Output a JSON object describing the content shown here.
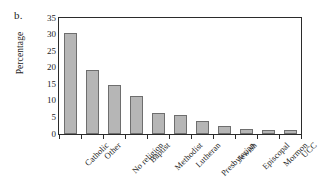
{
  "panel": {
    "label": "b."
  },
  "axes": {
    "ylabel": "Percentage",
    "xlabel": "",
    "yticks": [
      "0",
      "5",
      "10",
      "15",
      "20",
      "25",
      "30",
      "35"
    ]
  },
  "colors": {
    "bar_fill": "#b6b6b6",
    "bar_border": "#6e6e6e",
    "frame": "#2b2b2b",
    "text": "#1d1d1d",
    "background": "#ffffff"
  },
  "chart_data": {
    "type": "bar",
    "title": "",
    "subtitle": "",
    "xlabel": "",
    "ylabel": "Percentage",
    "ylim": [
      0,
      35
    ],
    "ytick_step": 5,
    "grid": false,
    "legend": null,
    "annotations": [],
    "categories": [
      "Catholic",
      "Other",
      "No religion",
      "Baptist",
      "Methodist",
      "Lutheran",
      "Presbyterian",
      "Jewish",
      "Episcopal",
      "Mormon",
      "UCC"
    ],
    "values": [
      30.5,
      19.3,
      14.8,
      11.5,
      6.3,
      5.7,
      3.9,
      2.5,
      1.5,
      1.2,
      1.2
    ]
  }
}
